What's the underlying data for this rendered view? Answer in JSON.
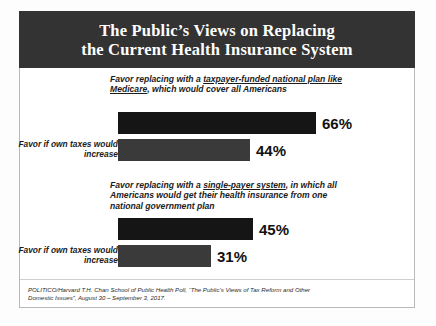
{
  "header": {
    "title_line1": "The Public’s Views on Replacing",
    "title_line2": "the Current Health Insurance System",
    "background_color": "#333333",
    "text_color": "#ffffff"
  },
  "chart_data": {
    "type": "bar",
    "title": "The Public’s Views on Replacing the Current Health Insurance System",
    "orientation": "horizontal",
    "xlabel": "",
    "ylabel": "",
    "xlim": [
      0,
      100
    ],
    "grid": false,
    "legend": "none",
    "value_suffix": "%",
    "groups": [
      {
        "heading_prefix": "Favor replacing with a ",
        "heading_underlined": "taxpayer-funded national plan like Medicare",
        "heading_suffix": ", which would cover all Americans",
        "categories": [
          "",
          "Favor if own taxes would increase"
        ],
        "values": [
          66,
          44
        ],
        "value_labels": [
          "66%",
          "44%"
        ],
        "colors": [
          "#151515",
          "#3a3a3a"
        ]
      },
      {
        "heading_prefix": "Favor replacing with a ",
        "heading_underlined": "single-payer system",
        "heading_suffix": ", in which all Americans would get their health insurance from one national government plan",
        "categories": [
          "",
          "Favor if own taxes would increase"
        ],
        "values": [
          45,
          31
        ],
        "value_labels": [
          "45%",
          "31%"
        ],
        "colors": [
          "#151515",
          "#3a3a3a"
        ]
      }
    ]
  },
  "footnote": {
    "line1": "POLITICO/Harvard T.H. Chan School of Public Health Poll, “The Public’s Views of Tax Reform and Other",
    "line2": "Domestic Issues”, August 30 – September 3, 2017."
  }
}
